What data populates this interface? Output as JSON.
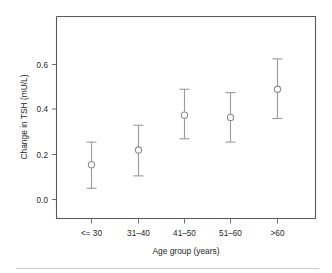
{
  "chart_data": {
    "type": "scatter",
    "title": "",
    "xlabel": "Age group (years)",
    "ylabel": "Change in TSH (mU/L)",
    "categories": [
      "<= 30",
      "31–40",
      "41–50",
      "51–60",
      ">60"
    ],
    "values": [
      0.155,
      0.22,
      0.375,
      0.365,
      0.49
    ],
    "error_low": [
      0.05,
      0.105,
      0.27,
      0.255,
      0.36
    ],
    "error_high": [
      0.255,
      0.33,
      0.49,
      0.475,
      0.625
    ],
    "series": [
      {
        "name": "Change in TSH",
        "values": [
          0.155,
          0.22,
          0.375,
          0.365,
          0.49
        ],
        "error_low": [
          0.05,
          0.105,
          0.27,
          0.255,
          0.36
        ],
        "error_high": [
          0.255,
          0.33,
          0.49,
          0.475,
          0.625
        ]
      }
    ],
    "ylim": [
      0.0,
      0.72
    ],
    "yticks": [
      0.0,
      0.2,
      0.4,
      0.6
    ],
    "ytick_labels": [
      "0.0",
      "0.2",
      "0.4",
      "0.6"
    ],
    "xtick_labels": [
      "<= 30",
      "31–40",
      "41–50",
      "51–60",
      ">60"
    ],
    "grid": false,
    "legend": "none",
    "marker": "open-circle",
    "errorbar_style": "capped",
    "colors": {
      "axis": "#58595b",
      "marker_stroke": "#8e8e90",
      "marker_fill": "#ffffff",
      "errorbar": "#9a9a9c",
      "text": "#231f20",
      "background": "#ffffff",
      "rule": "#c9cacc"
    }
  },
  "axes": {
    "y_tick_labels": [
      "0.6",
      "0.4",
      "0.2",
      "0.0"
    ],
    "y_title": "Change in TSH (mU/L)",
    "x_title": "Age group (years)",
    "x_tick_labels": [
      "<= 30",
      "31–40",
      "41–50",
      "51–60",
      ">60"
    ]
  }
}
